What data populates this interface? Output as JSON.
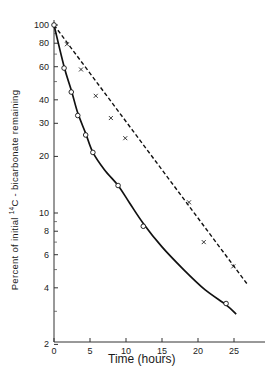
{
  "chart_data": {
    "type": "scatter",
    "title": "",
    "xlabel": "Time (hours)",
    "ylabel_parts": {
      "prefix": "Percent of initial ",
      "sup": "14",
      "suffix": "C - bicarbonate remaining"
    },
    "ylabel": "Percent of initial 14C - bicarbonate remaining",
    "xscale": "linear",
    "yscale": "log",
    "xlim": [
      0,
      29
    ],
    "ylim": [
      2,
      100
    ],
    "x_ticks": [
      0,
      5,
      10,
      15,
      20,
      25
    ],
    "x_tick_labels": [
      "0",
      "5",
      "10",
      "15",
      "20",
      "25"
    ],
    "y_ticks": [
      2,
      4,
      6,
      8,
      10,
      20,
      30,
      40,
      60,
      80,
      100
    ],
    "y_tick_labels": [
      "2",
      "4",
      "6",
      "8",
      "10",
      "20",
      "30",
      "40",
      "60",
      "80",
      "100"
    ],
    "y_minor_ticks": [
      3,
      5,
      7,
      9,
      50,
      70,
      90
    ],
    "grid": false,
    "legend": null,
    "series": [
      {
        "name": "circles (solid curve)",
        "marker": "o",
        "line": "solid",
        "x": [
          0,
          1.4,
          2.4,
          3.3,
          4.4,
          5.4,
          8.9,
          12.4,
          23.9
        ],
        "y": [
          100,
          59,
          44,
          33,
          26,
          21,
          14,
          8.5,
          3.3
        ],
        "curve": {
          "x": [
            0,
            1.4,
            2.4,
            3.3,
            4.4,
            5.4,
            7,
            8.9,
            10.5,
            12.4,
            15,
            18,
            21,
            23.9,
            25.3
          ],
          "y": [
            100,
            60,
            45,
            34,
            26.5,
            21,
            17,
            14,
            11.3,
            8.8,
            6.6,
            5.0,
            3.9,
            3.25,
            2.9
          ]
        }
      },
      {
        "name": "crosses (dashed line)",
        "marker": "x",
        "line": "dashed",
        "x": [
          1.8,
          3.75,
          5.8,
          7.9,
          9.9,
          18.75,
          20.8,
          24.9
        ],
        "y": [
          79,
          58,
          42,
          32,
          25,
          11.4,
          7.0,
          5.2
        ],
        "curve": {
          "x": [
            0,
            26.8
          ],
          "y": [
            100,
            4.2
          ]
        }
      }
    ]
  }
}
